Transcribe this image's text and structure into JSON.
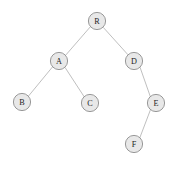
{
  "figure": {
    "type": "binary-tree-diagram",
    "background_color": "#ffffff",
    "node_fill_color": "#e8e8e8",
    "node_stroke_color": "#8d8d8d",
    "edge_color": "#b8b8b8",
    "label_color": "#1c1c1c",
    "node_radius": 8.6,
    "width": 179,
    "height": 171
  },
  "nodes": [
    {
      "id": "R",
      "label": "R",
      "cx": 97,
      "cy": 21,
      "depth": 0
    },
    {
      "id": "A",
      "label": "A",
      "cx": 59,
      "cy": 61,
      "depth": 1
    },
    {
      "id": "D",
      "label": "D",
      "cx": 134,
      "cy": 61,
      "depth": 1
    },
    {
      "id": "B",
      "label": "B",
      "cx": 22,
      "cy": 102,
      "depth": 2
    },
    {
      "id": "C",
      "label": "C",
      "cx": 90,
      "cy": 103,
      "depth": 2
    },
    {
      "id": "E",
      "label": "E",
      "cx": 156,
      "cy": 103,
      "depth": 2
    },
    {
      "id": "F",
      "label": "F",
      "cx": 134,
      "cy": 144,
      "depth": 3
    }
  ],
  "edges": [
    {
      "from": "R",
      "to": "A",
      "side": "left",
      "x1": 90.5,
      "y1": 26.6,
      "x2": 65.5,
      "y2": 55.4
    },
    {
      "from": "R",
      "to": "D",
      "side": "right",
      "x1": 103.2,
      "y1": 27.3,
      "x2": 128.0,
      "y2": 54.8
    },
    {
      "from": "A",
      "to": "B",
      "side": "left",
      "x1": 52.6,
      "y1": 66.8,
      "x2": 28.4,
      "y2": 96.2
    },
    {
      "from": "A",
      "to": "C",
      "side": "right",
      "x1": 65.0,
      "y1": 67.4,
      "x2": 84.2,
      "y2": 96.8
    },
    {
      "from": "D",
      "to": "E",
      "side": "right",
      "x1": 140.0,
      "y1": 67.2,
      "x2": 150.4,
      "y2": 96.8
    },
    {
      "from": "E",
      "to": "F",
      "side": "left",
      "x1": 150.6,
      "y1": 109.4,
      "x2": 139.8,
      "y2": 137.8
    }
  ],
  "caption": {
    "text": "",
    "visible": true,
    "legible": false,
    "note": "faint illegible caption clipped at bottom edge"
  }
}
